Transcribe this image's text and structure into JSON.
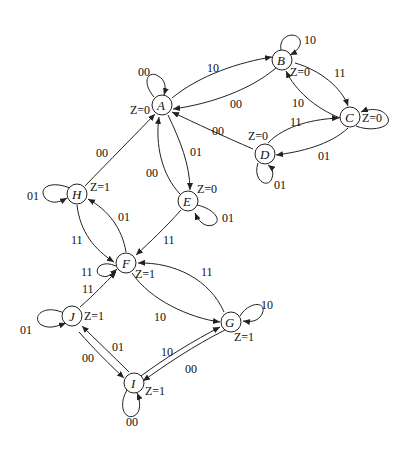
{
  "diagram": {
    "type": "state-transition-diagram",
    "states": [
      {
        "id": "A",
        "output": "Z=0",
        "x": 162,
        "y": 105
      },
      {
        "id": "B",
        "output": "Z=0",
        "x": 282,
        "y": 60
      },
      {
        "id": "C",
        "output": "Z=0",
        "x": 350,
        "y": 117
      },
      {
        "id": "D",
        "output": "Z=0",
        "x": 265,
        "y": 154
      },
      {
        "id": "E",
        "output": "Z=0",
        "x": 188,
        "y": 201
      },
      {
        "id": "F",
        "output": "Z=1",
        "x": 126,
        "y": 263
      },
      {
        "id": "G",
        "output": "Z=1",
        "x": 231,
        "y": 322
      },
      {
        "id": "H",
        "output": "Z=1",
        "x": 77,
        "y": 194
      },
      {
        "id": "I",
        "output": "Z=1",
        "x": 134,
        "y": 383
      },
      {
        "id": "J",
        "output": "Z=1",
        "x": 72,
        "y": 316
      }
    ],
    "transitions": [
      {
        "from": "A",
        "to": "A",
        "label": "00"
      },
      {
        "from": "A",
        "to": "B",
        "label": "10"
      },
      {
        "from": "A",
        "to": "E",
        "label": "01"
      },
      {
        "from": "B",
        "to": "B",
        "label": "10"
      },
      {
        "from": "B",
        "to": "A",
        "label": "00"
      },
      {
        "from": "B",
        "to": "C",
        "label": "11"
      },
      {
        "from": "C",
        "to": "C",
        "label": "Z=0"
      },
      {
        "from": "C",
        "to": "B",
        "label": "10"
      },
      {
        "from": "C",
        "to": "D",
        "label": "01"
      },
      {
        "from": "D",
        "to": "C",
        "label": "11"
      },
      {
        "from": "D",
        "to": "A",
        "label": "00"
      },
      {
        "from": "D",
        "to": "D",
        "label": "01"
      },
      {
        "from": "E",
        "to": "A",
        "label": "00"
      },
      {
        "from": "E",
        "to": "E",
        "label": "01"
      },
      {
        "from": "E",
        "to": "F",
        "label": "11"
      },
      {
        "from": "H",
        "to": "A",
        "label": "00"
      },
      {
        "from": "H",
        "to": "H",
        "label": "01"
      },
      {
        "from": "H",
        "to": "F",
        "label": "11"
      },
      {
        "from": "F",
        "to": "H",
        "label": "01"
      },
      {
        "from": "F",
        "to": "F",
        "label": "11"
      },
      {
        "from": "F",
        "to": "G",
        "label": "10"
      },
      {
        "from": "G",
        "to": "F",
        "label": "11"
      },
      {
        "from": "G",
        "to": "G",
        "label": "10"
      },
      {
        "from": "G",
        "to": "I",
        "label": "00"
      },
      {
        "from": "J",
        "to": "F",
        "label": "11"
      },
      {
        "from": "J",
        "to": "J",
        "label": "01"
      },
      {
        "from": "J",
        "to": "I",
        "label": "00"
      },
      {
        "from": "I",
        "to": "J",
        "label": "01"
      },
      {
        "from": "I",
        "to": "G",
        "label": "10"
      },
      {
        "from": "I",
        "to": "I",
        "label": "00"
      }
    ]
  }
}
